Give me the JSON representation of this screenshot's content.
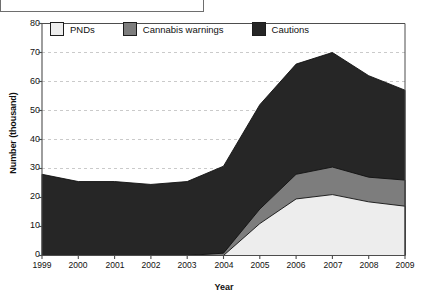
{
  "chart_data": {
    "type": "area",
    "stacked": true,
    "title": "",
    "xlabel": "Year",
    "ylabel": "Number (thousand)",
    "categories": [
      1999,
      2000,
      2001,
      2002,
      2003,
      2004,
      2005,
      2006,
      2007,
      2008,
      2009
    ],
    "xtick_labels": [
      "1999",
      "2000",
      "2001",
      "2002",
      "2003",
      "2004",
      "2005",
      "2006",
      "2007",
      "2008",
      "2009"
    ],
    "ytick_labels": [
      "0",
      "10",
      "20",
      "30",
      "40",
      "50",
      "60",
      "70",
      "80"
    ],
    "ytick_values": [
      0,
      10,
      20,
      30,
      40,
      50,
      60,
      70,
      80
    ],
    "ylim": [
      0,
      80
    ],
    "xlim": [
      1999,
      2009
    ],
    "grid": "horizontal-dashed",
    "legend_position": "top-inside-left",
    "series": [
      {
        "name": "PNDs",
        "color": "#ededed",
        "values": [
          0,
          0,
          0,
          0,
          0,
          0,
          11.0,
          19.5,
          21.0,
          18.5,
          17.0
        ]
      },
      {
        "name": "Cannabis warnings",
        "color": "#7d7d7d",
        "values": [
          0,
          0,
          0,
          0,
          0,
          0.8,
          5.0,
          8.5,
          9.5,
          8.5,
          9.0
        ]
      },
      {
        "name": "Cautions",
        "color": "#262626",
        "values": [
          28.0,
          25.5,
          25.5,
          24.5,
          25.5,
          30.0,
          36.0,
          38.0,
          39.5,
          35.0,
          31.0
        ]
      }
    ],
    "cumulative_tops": {
      "PNDs": [
        0,
        0,
        0,
        0,
        0,
        0,
        11.0,
        19.5,
        21.0,
        18.5,
        17.0
      ],
      "Cannabis warnings": [
        0,
        0,
        0,
        0,
        0,
        0.8,
        16.0,
        28.0,
        30.5,
        27.0,
        26.0
      ],
      "Cautions": [
        28.0,
        25.5,
        25.5,
        24.5,
        25.5,
        30.8,
        52.0,
        66.0,
        70.0,
        62.0,
        57.0
      ]
    },
    "colors": {
      "pnds": "#ededed",
      "cannabis_warnings": "#7d7d7d",
      "cautions": "#262626",
      "axis": "#4d4d4d",
      "grid": "#bdbdbd",
      "text": "#111111"
    }
  },
  "legend": {
    "items": [
      {
        "label": "PNDs",
        "swatch": "#ededed"
      },
      {
        "label": "Cannabis warnings",
        "swatch": "#7d7d7d"
      },
      {
        "label": "Cautions",
        "swatch": "#262626"
      }
    ]
  },
  "axes": {
    "ylabel": "Number (thousand)",
    "xlabel": "Year",
    "yticks": [
      "80",
      "70",
      "60",
      "50",
      "40",
      "30",
      "20",
      "10",
      "0"
    ],
    "xticks": [
      "1999",
      "2000",
      "2001",
      "2002",
      "2003",
      "2004",
      "2005",
      "2006",
      "2007",
      "2008",
      "2009"
    ]
  }
}
